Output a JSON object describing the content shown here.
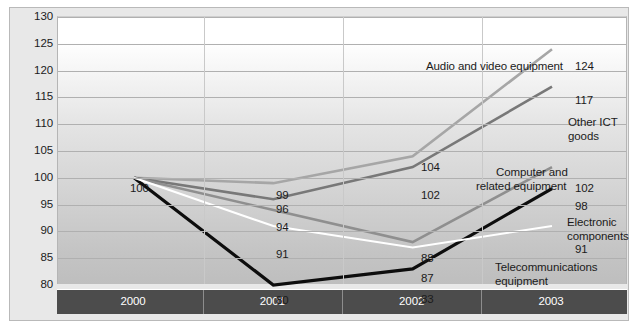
{
  "chart_data": {
    "type": "line",
    "title": "",
    "subtitle": "",
    "xlabel": "",
    "ylabel": "",
    "categories": [
      "2000",
      "2001",
      "2002",
      "2003"
    ],
    "ylim": [
      80,
      130
    ],
    "ytick_step": 5,
    "yticks": [
      130,
      125,
      120,
      115,
      110,
      105,
      100,
      95,
      90,
      85,
      80
    ],
    "grid": true,
    "legend": "inline-annotations",
    "series": [
      {
        "name": "Audio and video equipment",
        "color": "#a6a6a6",
        "values": [
          100,
          99,
          104,
          124
        ],
        "value_labels": [
          "100",
          "99",
          "104",
          "124"
        ]
      },
      {
        "name": "Other ICT goods",
        "color": "#787878",
        "values": [
          100,
          96,
          102,
          117
        ],
        "value_labels": [
          "100",
          "96",
          "102",
          "117"
        ]
      },
      {
        "name": "Computer and related equipment",
        "color": "#8f8f8f",
        "values": [
          100,
          94,
          88,
          102
        ],
        "value_labels": [
          "100",
          "94",
          "88",
          "102"
        ]
      },
      {
        "name": "Electronic components",
        "color": "#0d0d0d",
        "values": [
          100,
          80,
          83,
          98
        ],
        "value_labels": [
          "100",
          "80",
          "83",
          "98"
        ]
      },
      {
        "name": "Telecommunications equipment",
        "color": "#ffffff",
        "values": [
          100,
          91,
          87,
          91
        ],
        "value_labels": [
          "100",
          "91",
          "87",
          "91"
        ]
      }
    ],
    "point_labels": [
      {
        "text": "100",
        "x": 120,
        "y": 180
      },
      {
        "text": "99",
        "x": 266,
        "y": 187
      },
      {
        "text": "96",
        "x": 266,
        "y": 201
      },
      {
        "text": "94",
        "x": 266,
        "y": 219
      },
      {
        "text": "91",
        "x": 266,
        "y": 246
      },
      {
        "text": "80",
        "x": 266,
        "y": 292
      },
      {
        "text": "104",
        "x": 411,
        "y": 159
      },
      {
        "text": "102",
        "x": 411,
        "y": 187
      },
      {
        "text": "88",
        "x": 411,
        "y": 250
      },
      {
        "text": "87",
        "x": 411,
        "y": 270
      },
      {
        "text": "83",
        "x": 411,
        "y": 291
      },
      {
        "text": "124",
        "x": 565,
        "y": 58
      },
      {
        "text": "117",
        "x": 565,
        "y": 92
      },
      {
        "text": "102",
        "x": 565,
        "y": 180
      },
      {
        "text": "98",
        "x": 565,
        "y": 198
      },
      {
        "text": "91",
        "x": 565,
        "y": 241
      }
    ],
    "annotations": [
      {
        "text": "Audio and video equipment",
        "x": 416,
        "y": 52
      },
      {
        "text": "Other ICT",
        "x": 558,
        "y": 108
      },
      {
        "text": "goods",
        "x": 558,
        "y": 122
      },
      {
        "text": "Computer and",
        "x": 486,
        "y": 158
      },
      {
        "text": "related equipment",
        "x": 466,
        "y": 172
      },
      {
        "text": "Electronic",
        "x": 557,
        "y": 208
      },
      {
        "text": "components",
        "x": 557,
        "y": 222
      },
      {
        "text": "Telecommunications",
        "x": 485,
        "y": 253
      },
      {
        "text": "equipment",
        "x": 485,
        "y": 267
      }
    ]
  },
  "colors": {
    "frame_background": "#e8e8e8",
    "frame_border": "#b9b9b9",
    "gridline": "#b0b0b0",
    "x_band_background": "#4c4c4c",
    "x_band_text": "#ffffff",
    "axis_text": "#1b1b1b"
  }
}
